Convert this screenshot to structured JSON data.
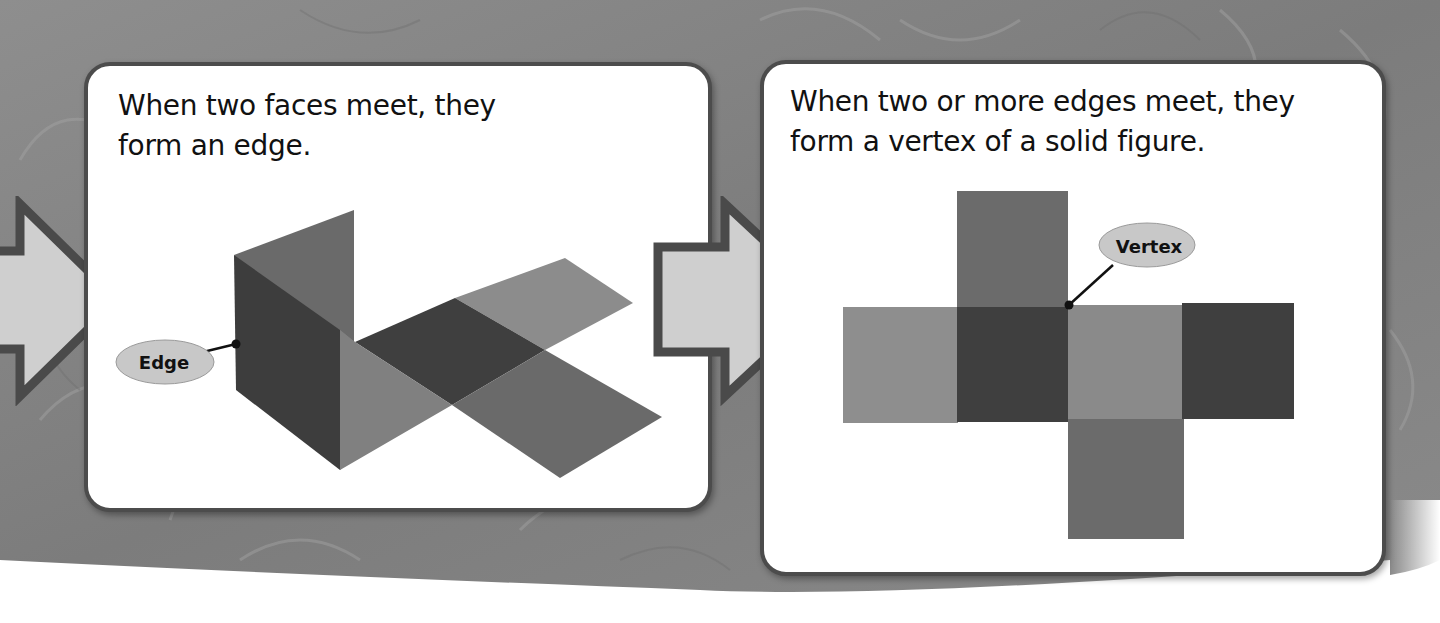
{
  "background": {
    "texture": "gray-marbled",
    "base_color": "#8a8a8a"
  },
  "panels": [
    {
      "caption": "When two faces meet, they form an edge.",
      "label": "Edge",
      "figure": "folded-net-prism",
      "colors": {
        "dark": "#3d3d3d",
        "mid": "#6a6a6a",
        "light": "#8c8c8c"
      }
    },
    {
      "caption": "When two or more edges meet, they form a vertex of a solid figure.",
      "label": "Vertex",
      "figure": "cube-net",
      "colors": {
        "dark": "#3f3f3f",
        "mid": "#6b6b6b",
        "light": "#8e8e8e"
      }
    }
  ],
  "arrows": [
    {
      "icon": "right-arrow-icon",
      "fill": "#cfcfcf",
      "stroke": "#4a4a4a"
    },
    {
      "icon": "right-arrow-icon",
      "fill": "#cfcfcf",
      "stroke": "#4a4a4a"
    }
  ],
  "callout": {
    "fill": "#c8c8c8",
    "line_color": "#111111"
  }
}
